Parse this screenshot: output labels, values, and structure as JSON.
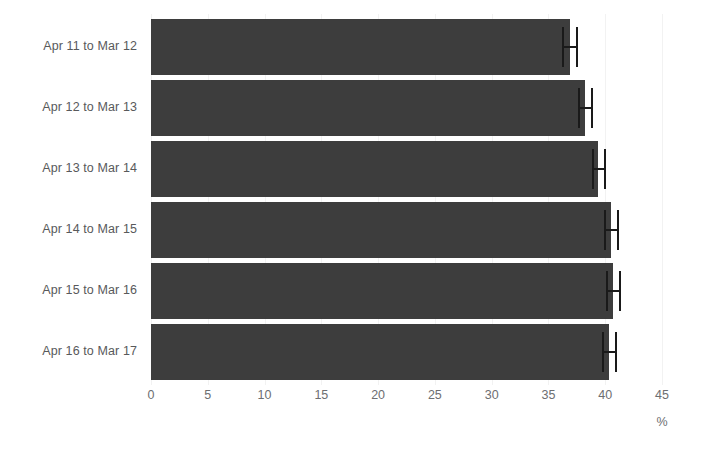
{
  "chart_data": {
    "type": "bar",
    "orientation": "horizontal",
    "title": "",
    "xlabel": "%",
    "ylabel": "",
    "categories": [
      "Apr 11 to Mar 12",
      "Apr 12 to Mar 13",
      "Apr 13 to Mar 14",
      "Apr 14 to Mar 15",
      "Apr 15 to Mar 16",
      "Apr 16 to Mar 17"
    ],
    "values": [
      36.9,
      38.2,
      39.4,
      40.5,
      40.7,
      40.3
    ],
    "error_low": [
      36.2,
      37.6,
      38.8,
      39.9,
      40.1,
      39.7
    ],
    "error_high": [
      37.6,
      38.9,
      40.1,
      41.2,
      41.4,
      41.0
    ],
    "xlim": [
      0,
      45
    ],
    "xticks": [
      0,
      5,
      10,
      15,
      20,
      25,
      30,
      35,
      40,
      45
    ],
    "xtick_labels": [
      "0",
      "5",
      "10",
      "15",
      "20",
      "25",
      "30",
      "35",
      "40",
      "45"
    ],
    "grid": true,
    "legend": "none",
    "bar_color": "#3d3d3d",
    "error_bar_color": "#1a1a1a",
    "gridline_color": "#f2f2f2",
    "label_color": "#58595b",
    "tick_label_color": "#6d6e71",
    "background_color": "#ffffff"
  },
  "axis": {
    "unit_label": "%"
  }
}
